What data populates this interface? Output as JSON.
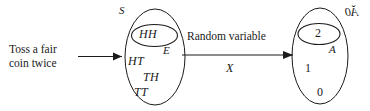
{
  "figure": {
    "type": "probability-mapping-diagram",
    "background_color": "#ffffff",
    "ink_color": "#1a1a1a",
    "source_text_line1": "Toss a fair",
    "source_text_line2": "coin twice",
    "mapping_caption": "Random variable",
    "mapping_symbol": "X"
  },
  "sample_space": {
    "set_label": "S",
    "event_label": "E",
    "event_outcomes": [
      "HH"
    ],
    "other_outcomes": [
      "HT",
      "TH",
      "TT"
    ]
  },
  "range_space": {
    "set_label": "Ă0",
    "subset_label": "A",
    "subset_values": [
      "2"
    ],
    "other_values": [
      "1",
      "0"
    ]
  },
  "arrows": {
    "source_to_sample": "arrow-right",
    "sample_to_range": "arrow-right"
  }
}
